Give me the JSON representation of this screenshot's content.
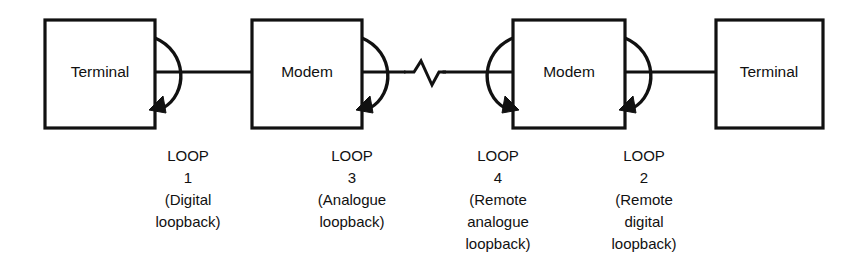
{
  "diagram": {
    "background_color": "#ffffff",
    "line_color": "#111111",
    "nodes": [
      {
        "id": "terminal-left",
        "label": "Terminal",
        "x": 45,
        "y": 20,
        "width": 110,
        "height": 108
      },
      {
        "id": "modem-left",
        "label": "Modem",
        "x": 252,
        "y": 20,
        "width": 110,
        "height": 108
      },
      {
        "id": "modem-right",
        "label": "Modem",
        "x": 513,
        "y": 20,
        "width": 112,
        "height": 108
      },
      {
        "id": "terminal-right",
        "label": "Terminal",
        "x": 716,
        "y": 20,
        "width": 107,
        "height": 108
      }
    ],
    "link_line_y": 72,
    "zigzag": {
      "label": "line-break-zigzag",
      "start_x": 402,
      "end_x": 446
    },
    "loops": [
      {
        "id": "loop-1",
        "number": "1",
        "name_line": "LOOP",
        "description_lines": [
          "(Digital",
          "loopback)"
        ],
        "caption_center_x": 188,
        "attached_to": "terminal-left",
        "direction": "right"
      },
      {
        "id": "loop-3",
        "number": "3",
        "name_line": "LOOP",
        "description_lines": [
          "(Analogue",
          "loopback)"
        ],
        "caption_center_x": 352,
        "attached_to": "modem-left",
        "direction": "right"
      },
      {
        "id": "loop-4",
        "number": "4",
        "name_line": "LOOP",
        "description_lines": [
          "(Remote",
          "analogue",
          "loopback)"
        ],
        "caption_center_x": 498,
        "attached_to": "modem-right",
        "direction": "left"
      },
      {
        "id": "loop-2",
        "number": "2",
        "name_line": "LOOP",
        "description_lines": [
          "(Remote",
          "digital",
          "loopback)"
        ],
        "caption_center_x": 644,
        "attached_to": "modem-right",
        "direction": "right"
      }
    ],
    "caption_rows": {
      "row1_y": 161,
      "row2_y": 183,
      "row3_y": 205,
      "row4_y": 227,
      "row5_y": 249
    }
  }
}
